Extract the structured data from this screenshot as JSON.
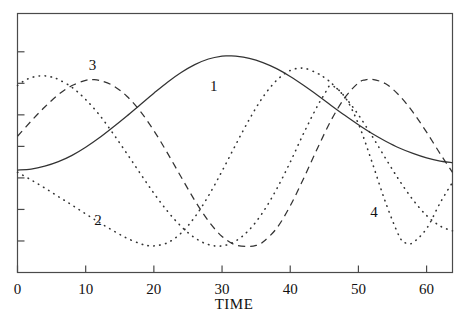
{
  "chart_data": {
    "type": "line",
    "title": "",
    "xlabel": "TIME",
    "ylabel": "",
    "xlim": [
      0,
      63.8
    ],
    "ylim": [
      0,
      1.15
    ],
    "grid": false,
    "legend_position": "inline-labels",
    "xticks": [
      0,
      10,
      20,
      30,
      40,
      50,
      60
    ],
    "xticklabels": [
      "0",
      "10",
      "20",
      "30",
      "40",
      "50",
      "60"
    ],
    "yticks": [
      0.14,
      0.28,
      0.42,
      0.56,
      0.7,
      0.84,
      0.98
    ],
    "yticklabels": [
      "",
      "",
      "",
      "",
      "",
      "",
      ""
    ],
    "series": [
      {
        "name": "1",
        "label": "1",
        "style": "solid",
        "color": "#333333",
        "label_x": 28.8,
        "label_y": 0.805,
        "x": [
          0,
          2,
          4,
          6,
          8,
          10,
          12,
          14,
          16,
          18,
          20,
          22,
          24,
          26,
          28,
          30,
          31,
          32,
          34,
          36,
          38,
          40,
          42,
          44,
          46,
          48,
          50,
          52,
          54,
          56,
          58,
          60,
          62,
          63.8
        ],
        "y": [
          0.455,
          0.459,
          0.472,
          0.492,
          0.52,
          0.556,
          0.598,
          0.645,
          0.694,
          0.745,
          0.796,
          0.845,
          0.888,
          0.923,
          0.948,
          0.961,
          0.962,
          0.961,
          0.951,
          0.932,
          0.905,
          0.87,
          0.83,
          0.787,
          0.742,
          0.698,
          0.656,
          0.617,
          0.583,
          0.553,
          0.529,
          0.509,
          0.495,
          0.488
        ]
      },
      {
        "name": "2",
        "label": "2",
        "style": "dotted",
        "color": "#333333",
        "label_x": 11.8,
        "label_y": 0.212,
        "x": [
          0,
          2,
          4,
          6,
          8,
          10,
          12,
          14,
          16,
          18,
          19,
          20,
          22,
          24,
          26,
          28,
          30,
          32,
          34,
          36,
          38,
          40,
          42,
          44,
          45,
          46,
          48,
          50,
          52,
          54,
          56,
          58,
          60,
          62,
          63.8
        ],
        "y": [
          0.445,
          0.411,
          0.375,
          0.337,
          0.299,
          0.26,
          0.222,
          0.186,
          0.153,
          0.128,
          0.12,
          0.118,
          0.132,
          0.175,
          0.246,
          0.34,
          0.45,
          0.567,
          0.68,
          0.779,
          0.853,
          0.897,
          0.907,
          0.884,
          0.866,
          0.842,
          0.78,
          0.7,
          0.606,
          0.506,
          0.409,
          0.323,
          0.253,
          0.206,
          0.185
        ]
      },
      {
        "name": "3",
        "label": "3",
        "style": "dashed",
        "color": "#333333",
        "label_x": 11.0,
        "label_y": 0.9,
        "x": [
          0,
          2,
          4,
          6,
          8,
          10,
          11,
          12,
          14,
          16,
          18,
          20,
          22,
          24,
          26,
          28,
          30,
          32,
          34,
          35,
          36,
          38,
          40,
          42,
          44,
          46,
          48,
          50,
          51,
          52,
          54,
          56,
          58,
          60,
          62,
          63.8
        ],
        "y": [
          0.605,
          0.672,
          0.735,
          0.79,
          0.83,
          0.853,
          0.856,
          0.853,
          0.83,
          0.784,
          0.716,
          0.63,
          0.53,
          0.424,
          0.32,
          0.229,
          0.16,
          0.122,
          0.116,
          0.12,
          0.135,
          0.196,
          0.296,
          0.42,
          0.552,
          0.676,
          0.776,
          0.842,
          0.855,
          0.858,
          0.838,
          0.786,
          0.712,
          0.623,
          0.527,
          0.445
        ]
      },
      {
        "name": "4",
        "label": "4",
        "style": "dotted",
        "color": "#333333",
        "label_x": 52.3,
        "label_y": 0.245,
        "x": [
          0,
          1,
          2,
          3,
          4,
          5,
          6,
          8,
          10,
          12,
          14,
          16,
          18,
          20,
          22,
          24,
          26,
          28,
          30,
          32,
          34,
          36,
          38,
          40,
          42,
          44,
          45,
          46,
          48,
          50,
          52,
          54,
          56,
          57,
          58,
          60,
          62,
          63.8
        ],
        "y": [
          0.83,
          0.852,
          0.865,
          0.872,
          0.873,
          0.868,
          0.857,
          0.822,
          0.768,
          0.7,
          0.618,
          0.53,
          0.44,
          0.352,
          0.272,
          0.205,
          0.154,
          0.124,
          0.118,
          0.14,
          0.19,
          0.268,
          0.37,
          0.49,
          0.62,
          0.74,
          0.79,
          0.83,
          0.78,
          0.66,
          0.49,
          0.31,
          0.16,
          0.13,
          0.133,
          0.195,
          0.31,
          0.4
        ]
      }
    ]
  },
  "axes": {
    "x_axis_name": "time-axis",
    "y_axis_name": "value-axis"
  }
}
